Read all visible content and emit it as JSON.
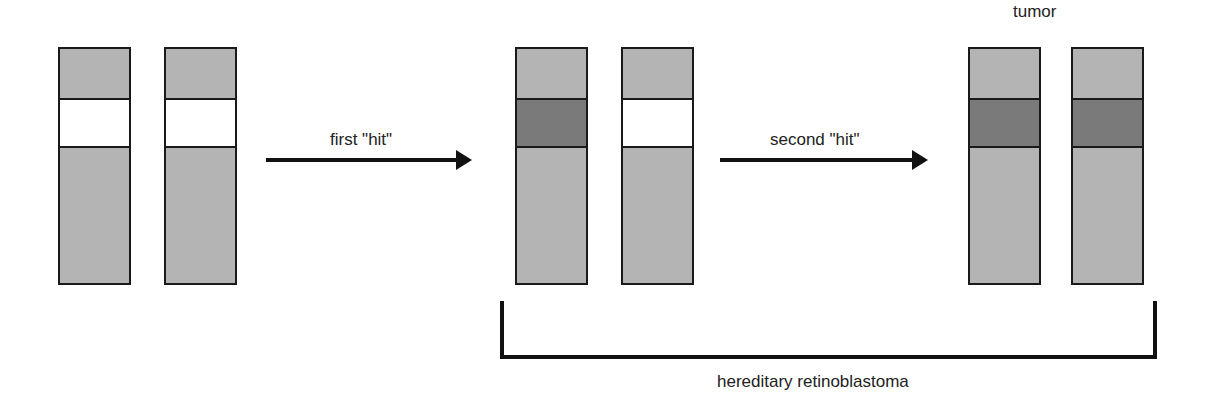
{
  "colors": {
    "normal": "#b4b4b4",
    "wildtype_locus": "#ffffff",
    "mutant_locus": "#7a7a7a",
    "outline": "#1a1a1a"
  },
  "stages": [
    {
      "name": "normal",
      "label": "",
      "chromosomes": [
        {
          "x": 58,
          "locus": "wildtype"
        },
        {
          "x": 164,
          "locus": "wildtype"
        }
      ]
    },
    {
      "name": "after-first-hit",
      "label": "",
      "chromosomes": [
        {
          "x": 515,
          "locus": "mutant"
        },
        {
          "x": 621,
          "locus": "wildtype"
        }
      ]
    },
    {
      "name": "tumor",
      "label": "tumor",
      "chromosomes": [
        {
          "x": 968,
          "locus": "mutant"
        },
        {
          "x": 1071,
          "locus": "mutant"
        }
      ]
    }
  ],
  "arrows": [
    {
      "label": "first \"hit\""
    },
    {
      "label": "second \"hit\""
    }
  ],
  "bracket": {
    "label": "hereditary retinoblastoma"
  }
}
